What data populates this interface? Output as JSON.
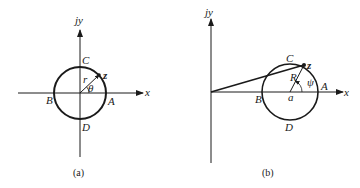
{
  "figures": [
    {
      "id": "a",
      "caption": "(a)",
      "axes": {
        "x_label": "x",
        "y_label": "jy"
      },
      "circle_center": "origin",
      "points": {
        "A": "A",
        "B": "B",
        "C": "C",
        "D": "D",
        "z": "z"
      },
      "radius_label": "r",
      "angle_label": "θ"
    },
    {
      "id": "b",
      "caption": "(b)",
      "axes": {
        "x_label": "x",
        "y_label": "jy"
      },
      "circle_center_label": "a",
      "points": {
        "A": "A",
        "B": "B",
        "C": "C",
        "D": "D",
        "z": "z"
      },
      "radius_label": "R",
      "angle_label": "ψ"
    }
  ],
  "colors": {
    "stroke": "#1a1a1a",
    "background": "#ffffff"
  }
}
